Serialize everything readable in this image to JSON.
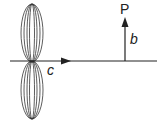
{
  "diagram": {
    "labels": {
      "point": "P",
      "vertical_segment": "b",
      "horizontal_axis": "c"
    },
    "colors": {
      "stroke": "#222222",
      "background": "#ffffff"
    },
    "elements": {
      "axis": {
        "x1": 10,
        "x2": 157,
        "y": 61
      },
      "axis_arrow": {
        "tip_x": 70,
        "y": 61
      },
      "lobe_center": {
        "x": 32,
        "y": 61
      },
      "lobe_half_height": 57,
      "lobe_widths": [
        12,
        9,
        6,
        3
      ],
      "vertical_arrow": {
        "x": 125,
        "y_bottom": 61,
        "y_tip": 18
      }
    }
  }
}
